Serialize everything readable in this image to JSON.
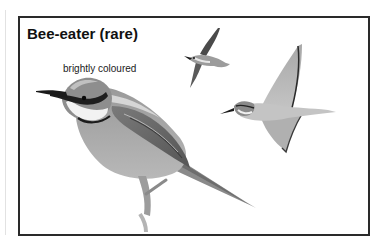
{
  "card": {
    "title": "Bee-eater (rare)",
    "caption": "brightly coloured"
  },
  "illustrations": [
    {
      "name": "perched-bee-eater",
      "description": "Perched bee-eater, side view, grayscale"
    },
    {
      "name": "flying-bee-eater-small",
      "description": "Small bee-eater in flight"
    },
    {
      "name": "flying-bee-eater-large",
      "description": "Bee-eater in flight, wings spread"
    }
  ],
  "colors": {
    "border": "#2a2a2a",
    "text": "#111111",
    "background": "#ffffff"
  }
}
